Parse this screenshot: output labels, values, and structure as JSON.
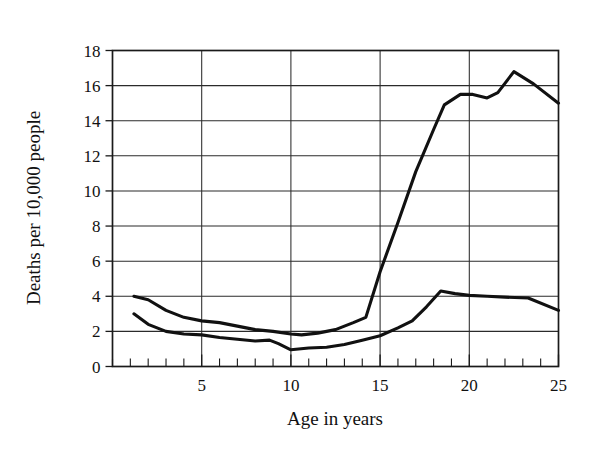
{
  "chart_data": {
    "type": "line",
    "title": "",
    "subtitle": "",
    "xlabel": "Age in years",
    "ylabel": "Deaths per 10,000 people",
    "xlim": [
      0,
      25
    ],
    "ylim": [
      0,
      18
    ],
    "grid": true,
    "legend_position": "none",
    "x_ticks_major": [
      5,
      10,
      15,
      20,
      25
    ],
    "x_tick_labels": [
      "5",
      "10",
      "15",
      "20",
      "25"
    ],
    "x_ticks_minor_step": 1,
    "y_ticks": [
      0,
      2,
      4,
      6,
      8,
      10,
      12,
      14,
      16,
      18
    ],
    "y_tick_labels": [
      "0",
      "2",
      "4",
      "6",
      "8",
      "10",
      "12",
      "14",
      "16",
      "18"
    ],
    "line_color": "#111111",
    "series": [
      {
        "name": "upper-curve",
        "x": [
          1.2,
          2.0,
          3.0,
          4.0,
          5.0,
          6.0,
          7.0,
          8.0,
          9.0,
          10.0,
          10.6,
          11.5,
          12.5,
          13.5,
          14.2,
          15.0,
          16.0,
          17.0,
          18.0,
          18.6,
          19.5,
          20.2,
          21.0,
          21.6,
          22.5,
          23.6,
          25.0
        ],
        "values": [
          4.0,
          3.8,
          3.2,
          2.8,
          2.6,
          2.5,
          2.3,
          2.1,
          2.0,
          1.85,
          1.8,
          1.9,
          2.1,
          2.5,
          2.8,
          5.4,
          8.2,
          11.1,
          13.5,
          14.9,
          15.5,
          15.5,
          15.3,
          15.6,
          16.8,
          16.1,
          15.0
        ]
      },
      {
        "name": "lower-curve",
        "x": [
          1.2,
          2.0,
          3.0,
          4.0,
          5.0,
          6.0,
          7.0,
          8.0,
          8.8,
          9.3,
          10.0,
          11.0,
          12.0,
          13.0,
          14.0,
          15.0,
          16.0,
          16.8,
          17.6,
          18.4,
          19.2,
          20.0,
          21.0,
          22.0,
          23.3,
          25.0
        ],
        "values": [
          3.0,
          2.4,
          2.0,
          1.85,
          1.8,
          1.65,
          1.55,
          1.45,
          1.5,
          1.3,
          0.95,
          1.05,
          1.1,
          1.25,
          1.5,
          1.75,
          2.2,
          2.6,
          3.4,
          4.3,
          4.15,
          4.05,
          4.0,
          3.95,
          3.9,
          3.2
        ]
      }
    ]
  },
  "axes": {
    "y_axis_title": "Deaths per 10,000 people",
    "x_axis_title": "Age in years"
  }
}
